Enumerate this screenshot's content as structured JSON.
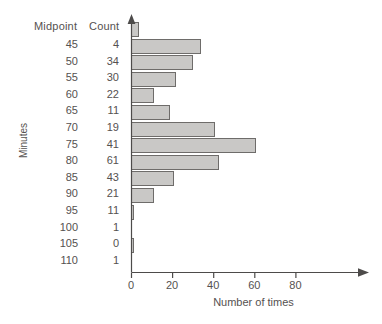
{
  "chart_data": {
    "type": "bar",
    "orientation": "horizontal",
    "title": "",
    "xlabel": "Number of times",
    "ylabel": "Minutes",
    "categories": [
      45,
      50,
      55,
      60,
      65,
      70,
      75,
      80,
      85,
      90,
      95,
      100,
      105,
      110
    ],
    "values": [
      4,
      34,
      30,
      22,
      11,
      19,
      41,
      61,
      43,
      21,
      11,
      1,
      0,
      1
    ],
    "xlim": [
      0,
      88
    ],
    "ylim_categories": "45 to 110 by 5",
    "xticks": [
      0,
      20,
      40,
      60,
      80
    ],
    "xtick_labels": [
      "0",
      "20",
      "40",
      "60",
      "80"
    ],
    "grid": false,
    "legend": false,
    "bar_fill_color": "#c9c8c6",
    "bar_edge_color": "#6e6c6a"
  },
  "table": {
    "headers": {
      "midpoint": "Midpoint",
      "count": "Count"
    },
    "rows": [
      {
        "midpoint": "45",
        "count": "4"
      },
      {
        "midpoint": "50",
        "count": "34"
      },
      {
        "midpoint": "55",
        "count": "30"
      },
      {
        "midpoint": "60",
        "count": "22"
      },
      {
        "midpoint": "65",
        "count": "11"
      },
      {
        "midpoint": "70",
        "count": "19"
      },
      {
        "midpoint": "75",
        "count": "41"
      },
      {
        "midpoint": "80",
        "count": "61"
      },
      {
        "midpoint": "85",
        "count": "43"
      },
      {
        "midpoint": "90",
        "count": "21"
      },
      {
        "midpoint": "95",
        "count": "11"
      },
      {
        "midpoint": "100",
        "count": "1"
      },
      {
        "midpoint": "105",
        "count": "0"
      },
      {
        "midpoint": "110",
        "count": "1"
      }
    ]
  },
  "axes": {
    "y_caption": "Minutes",
    "x_caption": "Number of times",
    "x_tick_labels": [
      "0",
      "20",
      "40",
      "60",
      "80"
    ]
  }
}
